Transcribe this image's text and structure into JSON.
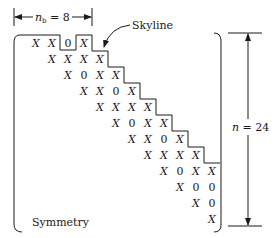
{
  "labels": {
    "nb_symbol": "n",
    "nb_subscript": "b",
    "nb_eq": " = 8",
    "skyline": "Skyline",
    "n_symbol": "n",
    "n_eq": " =  24",
    "symmetry": "Symmetry"
  },
  "matrix": {
    "rows": [
      [
        "X",
        "X",
        "0",
        "X"
      ],
      [
        "X",
        "X",
        "X",
        "X"
      ],
      [
        "X",
        "0",
        "X",
        "X"
      ],
      [
        "X",
        "X",
        "0",
        "X"
      ],
      [
        "X",
        "X",
        "X",
        "X"
      ],
      [
        "X",
        "0",
        "X",
        "X"
      ],
      [
        "X",
        "X",
        "0",
        "X"
      ],
      [
        "X",
        "X",
        "X",
        "X"
      ],
      [
        "X",
        "0",
        "X",
        "X"
      ],
      [
        "X",
        "0",
        "0"
      ],
      [
        "X",
        "0"
      ],
      [
        "X"
      ]
    ]
  }
}
